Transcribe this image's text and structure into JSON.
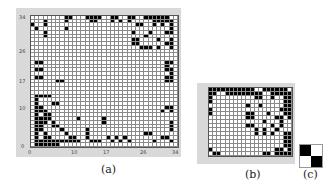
{
  "figure": {
    "panels": [
      {
        "id": "a",
        "caption": "(a)",
        "size": 35,
        "x_ticks": [
          "0",
          "10",
          "17",
          "26",
          "34"
        ],
        "y_ticks": [
          "34",
          "26",
          "17",
          "10",
          "0"
        ],
        "black_cells": [
          [
            0,
            1
          ],
          [
            0,
            2
          ],
          [
            0,
            3
          ],
          [
            0,
            4
          ],
          [
            0,
            5
          ],
          [
            0,
            6
          ],
          [
            1,
            1
          ],
          [
            1,
            2
          ],
          [
            1,
            3
          ],
          [
            1,
            4
          ],
          [
            1,
            5
          ],
          [
            1,
            6
          ],
          [
            1,
            7
          ],
          [
            1,
            8
          ],
          [
            1,
            9
          ],
          [
            1,
            10
          ],
          [
            1,
            11
          ],
          [
            1,
            14
          ],
          [
            1,
            15
          ],
          [
            1,
            16
          ],
          [
            1,
            19
          ],
          [
            1,
            21
          ],
          [
            1,
            23
          ],
          [
            1,
            29
          ],
          [
            1,
            33
          ],
          [
            2,
            1
          ],
          [
            2,
            3
          ],
          [
            2,
            4
          ],
          [
            2,
            9
          ],
          [
            2,
            10
          ],
          [
            2,
            13
          ],
          [
            2,
            18
          ],
          [
            2,
            20
          ],
          [
            2,
            22
          ],
          [
            2,
            31
          ],
          [
            2,
            32
          ],
          [
            3,
            1
          ],
          [
            3,
            3
          ],
          [
            3,
            8
          ],
          [
            3,
            13
          ],
          [
            3,
            27
          ],
          [
            3,
            28
          ],
          [
            4,
            1
          ],
          [
            4,
            2
          ],
          [
            4,
            7
          ],
          [
            4,
            13
          ],
          [
            4,
            33
          ],
          [
            5,
            1
          ],
          [
            5,
            2
          ],
          [
            5,
            5
          ],
          [
            5,
            6
          ],
          [
            5,
            33
          ],
          [
            6,
            1
          ],
          [
            6,
            2
          ],
          [
            6,
            3
          ],
          [
            6,
            5
          ],
          [
            6,
            17
          ],
          [
            6,
            33
          ],
          [
            7,
            1
          ],
          [
            7,
            2
          ],
          [
            7,
            3
          ],
          [
            7,
            4
          ],
          [
            7,
            11
          ],
          [
            7,
            17
          ],
          [
            8,
            1
          ],
          [
            8,
            3
          ],
          [
            8,
            4
          ],
          [
            9,
            1
          ],
          [
            9,
            2
          ],
          [
            9,
            3
          ],
          [
            9,
            31
          ],
          [
            9,
            33
          ],
          [
            10,
            1
          ],
          [
            10,
            2
          ],
          [
            10,
            32
          ],
          [
            10,
            33
          ],
          [
            11,
            1
          ],
          [
            11,
            5
          ],
          [
            11,
            6
          ],
          [
            12,
            1
          ],
          [
            13,
            1
          ],
          [
            13,
            2
          ],
          [
            13,
            3
          ],
          [
            13,
            4
          ],
          [
            17,
            6
          ],
          [
            17,
            7
          ],
          [
            17,
            32
          ],
          [
            17,
            33
          ],
          [
            18,
            1
          ],
          [
            18,
            2
          ],
          [
            18,
            32
          ],
          [
            18,
            33
          ],
          [
            19,
            33
          ],
          [
            20,
            1
          ],
          [
            20,
            2
          ],
          [
            20,
            32
          ],
          [
            20,
            33
          ],
          [
            21,
            32
          ],
          [
            22,
            1
          ],
          [
            22,
            2
          ],
          [
            22,
            32
          ],
          [
            22,
            33
          ],
          [
            26,
            26
          ],
          [
            26,
            27
          ],
          [
            26,
            28
          ],
          [
            26,
            30
          ],
          [
            26,
            33
          ],
          [
            27,
            24
          ],
          [
            27,
            25
          ],
          [
            27,
            32
          ],
          [
            27,
            33
          ],
          [
            28,
            24
          ],
          [
            28,
            25
          ],
          [
            28,
            30
          ],
          [
            28,
            33
          ],
          [
            29,
            3
          ],
          [
            29,
            27
          ],
          [
            30,
            3
          ],
          [
            30,
            24
          ],
          [
            30,
            28
          ],
          [
            30,
            32
          ],
          [
            30,
            33
          ],
          [
            31,
            1
          ],
          [
            31,
            8
          ],
          [
            31,
            33
          ],
          [
            32,
            0
          ],
          [
            32,
            3
          ],
          [
            32,
            25
          ],
          [
            32,
            26
          ],
          [
            32,
            29
          ],
          [
            32,
            31
          ],
          [
            32,
            33
          ],
          [
            33,
            3
          ],
          [
            33,
            8
          ],
          [
            33,
            14
          ],
          [
            33,
            15
          ],
          [
            33,
            19
          ],
          [
            33,
            21
          ],
          [
            33,
            23
          ],
          [
            33,
            29
          ],
          [
            33,
            30
          ],
          [
            33,
            31
          ],
          [
            33,
            32
          ],
          [
            33,
            33
          ],
          [
            34,
            8
          ],
          [
            34,
            9
          ],
          [
            34,
            13
          ],
          [
            34,
            14
          ],
          [
            34,
            15
          ],
          [
            34,
            16
          ],
          [
            34,
            19
          ],
          [
            34,
            20
          ],
          [
            34,
            23
          ],
          [
            34,
            24
          ],
          [
            34,
            27
          ],
          [
            34,
            28
          ],
          [
            34,
            29
          ],
          [
            34,
            30
          ],
          [
            34,
            31
          ],
          [
            34,
            32
          ]
        ]
      },
      {
        "id": "b",
        "caption": "(b)",
        "rows": 17,
        "cols": 20,
        "black_cells": [
          [
            0,
            0
          ],
          [
            0,
            1
          ],
          [
            0,
            2
          ],
          [
            0,
            3
          ],
          [
            0,
            4
          ],
          [
            0,
            5
          ],
          [
            0,
            6
          ],
          [
            0,
            7
          ],
          [
            0,
            8
          ],
          [
            0,
            9
          ],
          [
            0,
            10
          ],
          [
            0,
            13
          ],
          [
            0,
            14
          ],
          [
            0,
            15
          ],
          [
            0,
            16
          ],
          [
            0,
            17
          ],
          [
            0,
            18
          ],
          [
            1,
            0
          ],
          [
            1,
            1
          ],
          [
            1,
            4
          ],
          [
            1,
            5
          ],
          [
            1,
            6
          ],
          [
            1,
            7
          ],
          [
            1,
            8
          ],
          [
            1,
            9
          ],
          [
            1,
            10
          ],
          [
            1,
            11
          ],
          [
            1,
            12
          ],
          [
            1,
            15
          ],
          [
            1,
            16
          ],
          [
            1,
            17
          ],
          [
            1,
            18
          ],
          [
            1,
            19
          ],
          [
            2,
            0
          ],
          [
            2,
            11
          ],
          [
            2,
            12
          ],
          [
            2,
            15
          ],
          [
            2,
            18
          ],
          [
            2,
            19
          ],
          [
            3,
            0
          ],
          [
            3,
            18
          ],
          [
            3,
            19
          ],
          [
            4,
            9
          ],
          [
            4,
            12
          ],
          [
            4,
            18
          ],
          [
            4,
            19
          ],
          [
            5,
            0
          ],
          [
            5,
            17
          ],
          [
            5,
            18
          ],
          [
            5,
            19
          ],
          [
            6,
            0
          ],
          [
            6,
            9
          ],
          [
            6,
            10
          ],
          [
            6,
            14
          ],
          [
            6,
            18
          ],
          [
            6,
            19
          ],
          [
            7,
            9
          ],
          [
            7,
            10
          ],
          [
            7,
            16
          ],
          [
            7,
            17
          ],
          [
            7,
            19
          ],
          [
            8,
            13
          ],
          [
            8,
            17
          ],
          [
            9,
            9
          ],
          [
            9,
            10
          ],
          [
            9,
            15
          ],
          [
            9,
            17
          ],
          [
            10,
            11
          ],
          [
            10,
            13
          ],
          [
            10,
            16
          ],
          [
            11,
            11
          ],
          [
            11,
            13
          ],
          [
            11,
            15
          ],
          [
            11,
            18
          ],
          [
            11,
            19
          ],
          [
            12,
            18
          ],
          [
            12,
            19
          ],
          [
            13,
            18
          ],
          [
            13,
            19
          ],
          [
            14,
            18
          ],
          [
            14,
            19
          ],
          [
            15,
            0
          ],
          [
            15,
            16
          ],
          [
            15,
            17
          ],
          [
            15,
            19
          ],
          [
            16,
            1
          ],
          [
            16,
            2
          ],
          [
            16,
            13
          ],
          [
            16,
            14
          ],
          [
            16,
            16
          ],
          [
            16,
            17
          ],
          [
            16,
            18
          ],
          [
            16,
            19
          ]
        ]
      },
      {
        "id": "c",
        "caption": "(c)",
        "cells": [
          [
            1,
            0
          ],
          [
            0,
            1
          ]
        ]
      }
    ]
  }
}
